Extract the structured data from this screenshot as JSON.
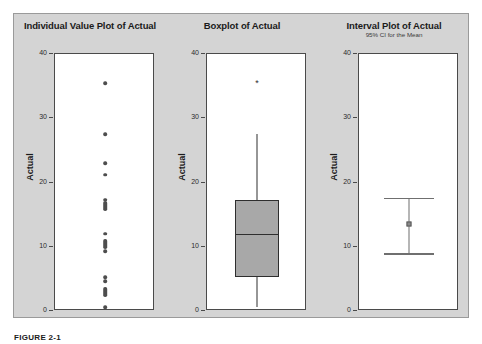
{
  "figure": {
    "caption": "FIGURE 2-1",
    "background_color": "#d4d4d4",
    "plot_background_color": "#ffffff"
  },
  "panels": [
    {
      "id": "individual-value-plot",
      "title": "Individual Value Plot of Actual",
      "subtitle": "",
      "ylabel": "Actual"
    },
    {
      "id": "boxplot",
      "title": "Boxplot of Actual",
      "subtitle": "",
      "ylabel": "Actual"
    },
    {
      "id": "interval-plot",
      "title": "Interval Plot of Actual",
      "subtitle": "95% CI for the Mean",
      "ylabel": "Actual"
    }
  ],
  "axis": {
    "ticks": [
      40,
      30,
      20,
      10,
      0
    ],
    "tick_labels": [
      "40",
      "30",
      "20",
      "10",
      "0"
    ],
    "ylim": [
      0,
      40
    ]
  },
  "chart_data": [
    {
      "type": "scatter",
      "title": "Individual Value Plot of Actual",
      "xlabel": "",
      "ylabel": "Actual",
      "ylim": [
        0,
        40
      ],
      "grid": false,
      "legend": "none",
      "variable": "Actual",
      "values": [
        35.5,
        27.5,
        23.0,
        21.2,
        17.3,
        16.5,
        16.2,
        15.9,
        12.0,
        10.6,
        10.2,
        9.9,
        9.3,
        5.3,
        4.6,
        3.3,
        3.0,
        2.7,
        0.6
      ],
      "stacks": [
        {
          "value": 35.5,
          "count": 1
        },
        {
          "value": 27.5,
          "count": 1
        },
        {
          "value": 23.0,
          "count": 1
        },
        {
          "value": 21.2,
          "count": 1
        },
        {
          "value": 17.3,
          "count": 1
        },
        {
          "value": 16.3,
          "count": 3
        },
        {
          "value": 12.0,
          "count": 1
        },
        {
          "value": 10.4,
          "count": 3
        },
        {
          "value": 9.3,
          "count": 1
        },
        {
          "value": 5.3,
          "count": 1
        },
        {
          "value": 4.6,
          "count": 1
        },
        {
          "value": 3.0,
          "count": 3
        },
        {
          "value": 0.6,
          "count": 1
        }
      ]
    },
    {
      "type": "boxplot",
      "title": "Boxplot of Actual",
      "xlabel": "",
      "ylabel": "Actual",
      "ylim": [
        0,
        40
      ],
      "grid": false,
      "legend": "none",
      "variable": "Actual",
      "box": {
        "lower_whisker": 0.6,
        "q1": 5.3,
        "median": 12.0,
        "q3": 17.3,
        "upper_whisker": 27.5,
        "outliers": [
          35.5
        ]
      },
      "box_fill_color": "#a8a8a8",
      "box_line_color": "#2e2e2e"
    },
    {
      "type": "interval",
      "title": "Interval Plot of Actual",
      "subtitle": "95% CI for the Mean",
      "xlabel": "",
      "ylabel": "Actual",
      "ylim": [
        0,
        40
      ],
      "grid": false,
      "legend": "none",
      "variable": "Actual",
      "mean": 13.5,
      "ci_lower": 9.0,
      "ci_upper": 17.6,
      "confidence_level": "95%",
      "marker_color": "#8a8a8a",
      "line_color": "#6f6f6f"
    }
  ]
}
